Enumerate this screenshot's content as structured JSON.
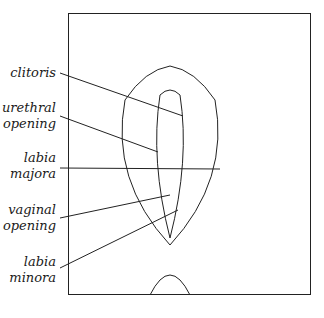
{
  "diagram": {
    "type": "anatomical-line-drawing",
    "style": "black ink line illustration, italic serif labels with leader lines",
    "labels": [
      {
        "id": "clitoris",
        "lines": [
          "clitoris"
        ]
      },
      {
        "id": "urethral-opening",
        "lines": [
          "urethral",
          "opening"
        ]
      },
      {
        "id": "labia-majora",
        "lines": [
          "labia",
          "majora"
        ]
      },
      {
        "id": "vaginal-opening",
        "lines": [
          "vaginal",
          "opening"
        ]
      },
      {
        "id": "labia-minora",
        "lines": [
          "labia",
          "minora"
        ]
      }
    ],
    "colors": {
      "ink": "#1a1a1a",
      "background": "#ffffff"
    }
  }
}
